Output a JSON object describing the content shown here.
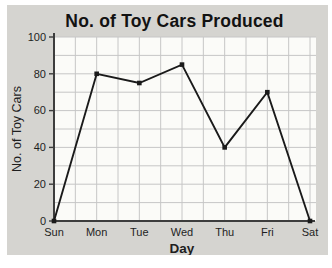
{
  "chart_data": {
    "type": "line",
    "title": "No. of Toy Cars Produced",
    "xlabel": "Day",
    "ylabel": "No. of Toy Cars",
    "categories": [
      "Sun",
      "Mon",
      "Tue",
      "Wed",
      "Thu",
      "Fri",
      "Sat"
    ],
    "values": [
      0,
      80,
      75,
      85,
      40,
      70,
      0
    ],
    "ylim": [
      0,
      100
    ],
    "ytick_step": 20,
    "minor_grid_step_y": 10,
    "minor_grid_divisions_x": 2,
    "grid": true,
    "legend": false,
    "colors": {
      "line": "#1a1a1a",
      "marker": "#1a1a1a",
      "grid": "#c6c6c6",
      "axis": "#3d3d3d",
      "panel_bg": "#d5d4d0",
      "plot_bg": "#fbfbf8",
      "text": "#1e1e1e"
    }
  }
}
